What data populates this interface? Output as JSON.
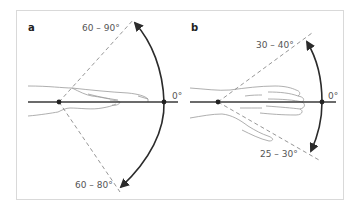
{
  "figure": {
    "panels": [
      {
        "id": "a",
        "label": "a",
        "upper_angle": "60 – 90°",
        "lower_angle": "60 – 80°",
        "zero_label": "0°",
        "description": "Wrist extension (upper) and flexion (lower) range of motion, lateral view of hand"
      },
      {
        "id": "b",
        "label": "b",
        "upper_angle": "30 – 40°",
        "lower_angle": "25 – 30°",
        "zero_label": "0°",
        "description": "Wrist radial (upper) and ulnar (lower) deviation range of motion, dorsal view of hand"
      }
    ],
    "colors": {
      "frame": "#d9d9d9",
      "axis": "#3a3a3a",
      "arc": "#2b2b2b",
      "dashed": "#8a8a8a",
      "text": "#555555"
    }
  }
}
